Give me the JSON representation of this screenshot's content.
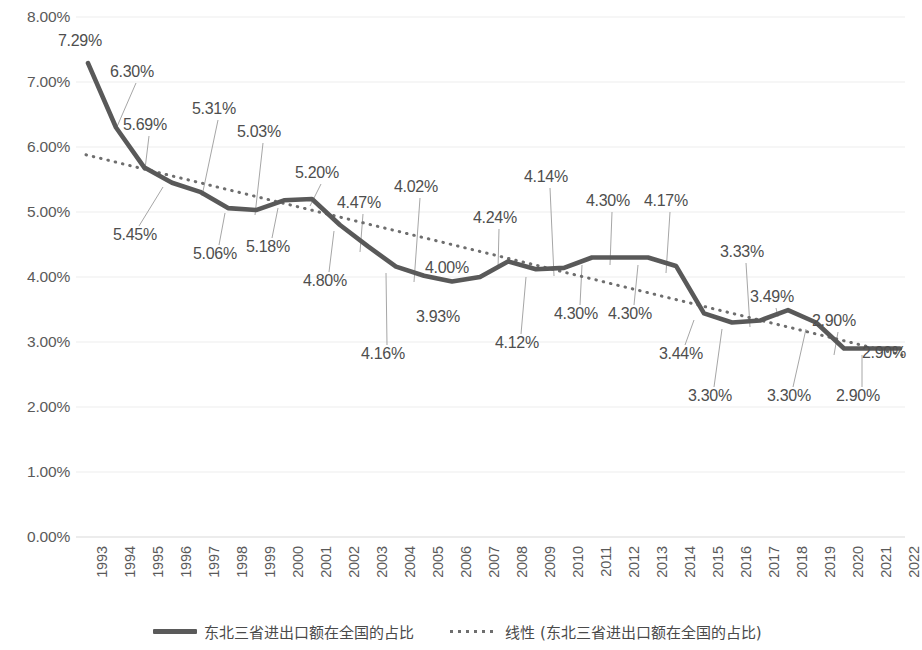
{
  "chart_data": {
    "type": "line",
    "title": "",
    "xlabel": "",
    "ylabel": "",
    "ylim": [
      0,
      8
    ],
    "ytick_labels": [
      "8.00%",
      "7.00%",
      "6.00%",
      "5.00%",
      "4.00%",
      "3.00%",
      "2.00%",
      "1.00%",
      "0.00%"
    ],
    "ytick_values": [
      8,
      7,
      6,
      5,
      4,
      3,
      2,
      1,
      0
    ],
    "grid": true,
    "legend_position": "bottom",
    "categories": [
      "1993",
      "1994",
      "1995",
      "1996",
      "1997",
      "1998",
      "1999",
      "2000",
      "2001",
      "2002",
      "2003",
      "2004",
      "2005",
      "2006",
      "2007",
      "2008",
      "2009",
      "2010",
      "2011",
      "2012",
      "2013",
      "2014",
      "2015",
      "2016",
      "2017",
      "2018",
      "2019",
      "2020",
      "2021",
      "2022"
    ],
    "series": [
      {
        "name": "东北三省进出口额在全国的占比",
        "style": "solid",
        "color": "#595959",
        "values": [
          7.29,
          6.3,
          5.69,
          5.45,
          5.31,
          5.06,
          5.03,
          5.18,
          5.2,
          4.8,
          4.47,
          4.16,
          4.02,
          3.93,
          4.0,
          4.24,
          4.12,
          4.14,
          4.3,
          4.3,
          4.3,
          4.17,
          3.44,
          3.3,
          3.33,
          3.49,
          3.3,
          2.9,
          2.9,
          2.9
        ],
        "data_labels": [
          "7.29%",
          "6.30%",
          "5.69%",
          "5.45%",
          "5.31%",
          "5.06%",
          "5.03%",
          "5.18%",
          "5.20%",
          "4.80%",
          "4.47%",
          "4.16%",
          "4.02%",
          "3.93%",
          "4.00%",
          "4.24%",
          "4.12%",
          "4.14%",
          "4.30%",
          "4.30%",
          "4.30%",
          "4.17%",
          "3.44%",
          "3.30%",
          "3.33%",
          "3.49%",
          "3.30%",
          "2.90%",
          "2.90%",
          "2.90%"
        ]
      },
      {
        "name": "线性 (东北三省进出口额在全国的占比)",
        "style": "dotted",
        "color": "#6e6e6e",
        "trendline": true,
        "start_value": 5.88,
        "end_value": 2.8
      }
    ]
  },
  "y_axis": {
    "ticks": [
      {
        "label": "8.00%",
        "value": 8
      },
      {
        "label": "7.00%",
        "value": 7
      },
      {
        "label": "6.00%",
        "value": 6
      },
      {
        "label": "5.00%",
        "value": 5
      },
      {
        "label": "4.00%",
        "value": 4
      },
      {
        "label": "3.00%",
        "value": 3
      },
      {
        "label": "2.00%",
        "value": 2
      },
      {
        "label": "1.00%",
        "value": 1
      },
      {
        "label": "0.00%",
        "value": 0
      }
    ]
  },
  "x_axis": {
    "ticks": [
      "1993",
      "1994",
      "1995",
      "1996",
      "1997",
      "1998",
      "1999",
      "2000",
      "2001",
      "2002",
      "2003",
      "2004",
      "2005",
      "2006",
      "2007",
      "2008",
      "2009",
      "2010",
      "2011",
      "2012",
      "2013",
      "2014",
      "2015",
      "2016",
      "2017",
      "2018",
      "2019",
      "2020",
      "2021",
      "2022"
    ]
  },
  "data_labels": [
    {
      "text": "7.29%",
      "x": 58,
      "y": 32,
      "anchor_x": 88,
      "anchor_y": 65,
      "leader": false
    },
    {
      "text": "6.30%",
      "x": 110,
      "y": 63,
      "anchor_x": 116,
      "anchor_y": 129,
      "leader": true
    },
    {
      "text": "5.69%",
      "x": 123,
      "y": 116,
      "anchor_x": 145,
      "anchor_y": 169,
      "leader": true
    },
    {
      "text": "5.45%",
      "x": 113,
      "y": 226,
      "anchor_x": 163,
      "anchor_y": 187,
      "leader": true
    },
    {
      "text": "5.31%",
      "x": 192,
      "y": 100,
      "anchor_x": 202,
      "anchor_y": 196,
      "leader": true
    },
    {
      "text": "5.06%",
      "x": 193,
      "y": 245,
      "anchor_x": 225,
      "anchor_y": 213,
      "leader": true
    },
    {
      "text": "5.03%",
      "x": 237,
      "y": 123,
      "anchor_x": 255,
      "anchor_y": 215,
      "leader": true
    },
    {
      "text": "5.18%",
      "x": 246,
      "y": 238,
      "anchor_x": 278,
      "anchor_y": 208,
      "leader": true
    },
    {
      "text": "5.20%",
      "x": 295,
      "y": 164,
      "anchor_x": 310,
      "anchor_y": 206,
      "leader": true
    },
    {
      "text": "4.80%",
      "x": 303,
      "y": 272,
      "anchor_x": 334,
      "anchor_y": 231,
      "leader": true
    },
    {
      "text": "4.47%",
      "x": 337,
      "y": 194,
      "anchor_x": 360,
      "anchor_y": 252,
      "leader": true
    },
    {
      "text": "4.16%",
      "x": 361,
      "y": 345,
      "anchor_x": 386,
      "anchor_y": 273,
      "leader": true
    },
    {
      "text": "4.02%",
      "x": 394,
      "y": 178,
      "anchor_x": 414,
      "anchor_y": 282,
      "leader": true
    },
    {
      "text": "3.93%",
      "x": 416,
      "y": 308,
      "anchor_x": 442,
      "anchor_y": 290,
      "leader": false
    },
    {
      "text": "4.00%",
      "x": 425,
      "y": 259,
      "anchor_x": 470,
      "anchor_y": 285,
      "leader": false
    },
    {
      "text": "4.24%",
      "x": 473,
      "y": 209,
      "anchor_x": 498,
      "anchor_y": 269,
      "leader": true
    },
    {
      "text": "4.12%",
      "x": 495,
      "y": 334,
      "anchor_x": 526,
      "anchor_y": 277,
      "leader": true
    },
    {
      "text": "4.14%",
      "x": 524,
      "y": 168,
      "anchor_x": 554,
      "anchor_y": 276,
      "leader": true
    },
    {
      "text": "4.30%",
      "x": 554,
      "y": 305,
      "anchor_x": 582,
      "anchor_y": 265,
      "leader": true
    },
    {
      "text": "4.30%",
      "x": 586,
      "y": 192,
      "anchor_x": 610,
      "anchor_y": 265,
      "leader": true
    },
    {
      "text": "4.30%",
      "x": 608,
      "y": 305,
      "anchor_x": 638,
      "anchor_y": 265,
      "leader": true
    },
    {
      "text": "4.17%",
      "x": 644,
      "y": 192,
      "anchor_x": 666,
      "anchor_y": 273,
      "leader": true
    },
    {
      "text": "3.44%",
      "x": 659,
      "y": 345,
      "anchor_x": 694,
      "anchor_y": 320,
      "leader": true
    },
    {
      "text": "3.30%",
      "x": 688,
      "y": 387,
      "anchor_x": 722,
      "anchor_y": 329,
      "leader": true
    },
    {
      "text": "3.33%",
      "x": 720,
      "y": 243,
      "anchor_x": 750,
      "anchor_y": 327,
      "leader": true
    },
    {
      "text": "3.49%",
      "x": 750,
      "y": 288,
      "anchor_x": 778,
      "anchor_y": 317,
      "leader": true
    },
    {
      "text": "3.30%",
      "x": 767,
      "y": 387,
      "anchor_x": 806,
      "anchor_y": 329,
      "leader": true
    },
    {
      "text": "2.90%",
      "x": 812,
      "y": 312,
      "anchor_x": 834,
      "anchor_y": 355,
      "leader": true
    },
    {
      "text": "2.90%",
      "x": 836,
      "y": 387,
      "anchor_x": 862,
      "anchor_y": 355,
      "leader": true
    },
    {
      "text": "2.90%",
      "x": 862,
      "y": 344,
      "anchor_x": 890,
      "anchor_y": 355,
      "leader": false
    }
  ],
  "legend": {
    "items": [
      {
        "label": "东北三省进出口额在全国的占比",
        "style": "solid"
      },
      {
        "label": "线性 (东北三省进出口额在全国的占比)",
        "style": "dotted"
      }
    ]
  }
}
